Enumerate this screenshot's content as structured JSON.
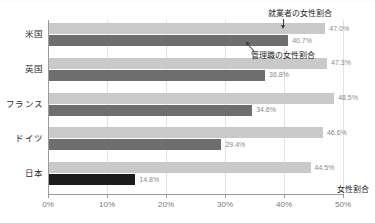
{
  "chart_data": {
    "type": "bar",
    "orientation": "horizontal",
    "title": "",
    "xlabel": "女性割合",
    "ylabel": "",
    "categories": [
      "米国",
      "英国",
      "フランス",
      "ドイツ",
      "日本"
    ],
    "series": [
      {
        "name": "就業者の女性割合",
        "color": "#c9c9c9",
        "values": [
          47.0,
          47.3,
          48.5,
          46.6,
          44.5
        ],
        "labels": [
          "47.0%",
          "47.3%",
          "48.5%",
          "46.6%",
          "44.5%"
        ]
      },
      {
        "name": "管理職の女性割合",
        "color": "#6e6e6e",
        "values": [
          40.7,
          36.8,
          34.6,
          29.4,
          14.8
        ],
        "labels": [
          "40.7%",
          "36.8%",
          "34.6%",
          "29.4%",
          "14.8%"
        ]
      }
    ],
    "xlim": [
      0,
      50
    ],
    "xticks": [
      0,
      10,
      20,
      30,
      40,
      50
    ],
    "xtick_labels": [
      "0%",
      "10%",
      "20%",
      "30%",
      "40%",
      "50%"
    ],
    "grid": true,
    "grid_axis": "x",
    "legend": "annotations",
    "annotations": [
      {
        "text": "就業者の女性割合",
        "points_to_series": "就業者の女性割合",
        "points_to_category": "米国"
      },
      {
        "text": "管理職の女性割合",
        "points_to_series": "管理職の女性割合",
        "points_to_category": "米国"
      }
    ],
    "highlight": {
      "category": "日本",
      "series": "管理職の女性割合",
      "color": "#1c1c1c"
    }
  }
}
